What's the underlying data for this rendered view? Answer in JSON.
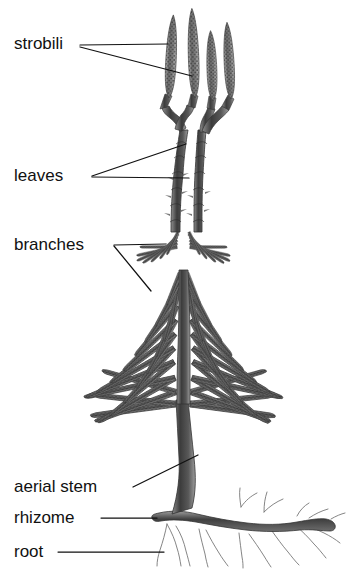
{
  "figure": {
    "background_color": "#ffffff",
    "ink_color": "#111111",
    "plant_color_dark": "#3a3a3a",
    "plant_color_mid": "#6b6b6b",
    "plant_color_light": "#9a9a9a",
    "width": 346,
    "height": 569
  },
  "labels": [
    {
      "id": "strobili",
      "text": "strobili",
      "text_x": 14,
      "text_y": 45,
      "leaders": [
        {
          "x1": 80,
          "y1": 45,
          "x2": 168,
          "y2": 44
        },
        {
          "x1": 80,
          "y1": 47,
          "x2": 192,
          "y2": 76
        }
      ]
    },
    {
      "id": "leaves",
      "text": "leaves",
      "text_x": 14,
      "text_y": 177,
      "leaders": [
        {
          "x1": 92,
          "y1": 176,
          "x2": 186,
          "y2": 144
        },
        {
          "x1": 92,
          "y1": 177,
          "x2": 189,
          "y2": 178
        }
      ]
    },
    {
      "id": "branches",
      "text": "branches",
      "text_x": 14,
      "text_y": 246,
      "leaders": [
        {
          "x1": 114,
          "y1": 245,
          "x2": 166,
          "y2": 244
        },
        {
          "x1": 114,
          "y1": 246,
          "x2": 151,
          "y2": 291
        }
      ]
    },
    {
      "id": "aerial-stem",
      "text": "aerial stem",
      "text_x": 14,
      "text_y": 488,
      "leaders": [
        {
          "x1": 133,
          "y1": 487,
          "x2": 198,
          "y2": 455
        }
      ]
    },
    {
      "id": "rhizome",
      "text": "rhizome",
      "text_x": 14,
      "text_y": 519,
      "leaders": [
        {
          "x1": 101,
          "y1": 518,
          "x2": 157,
          "y2": 518
        }
      ]
    },
    {
      "id": "root",
      "text": "root",
      "text_x": 14,
      "text_y": 553,
      "leaders": [
        {
          "x1": 58,
          "y1": 552,
          "x2": 164,
          "y2": 552
        }
      ]
    }
  ]
}
